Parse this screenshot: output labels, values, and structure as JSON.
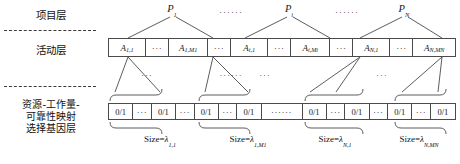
{
  "figure": {
    "layers": [
      {
        "id": "project",
        "label": "项目层"
      },
      {
        "id": "activity",
        "label": "活动层"
      },
      {
        "id": "gene",
        "label": "资源-工作量-\n可靠性映射\n选择基因层"
      }
    ],
    "separators": [
      "dashed",
      "dashed"
    ]
  },
  "project_layer": {
    "nodes": [
      {
        "base": "P",
        "sub": "1",
        "x": 172
      },
      {
        "base": "P",
        "sub": "i",
        "x": 289
      },
      {
        "base": "P",
        "sub": "N",
        "x": 404
      }
    ],
    "ellipses": [
      {
        "text": "······",
        "x": 231
      },
      {
        "text": "······",
        "x": 347
      }
    ]
  },
  "activity_layer": {
    "cells": [
      {
        "type": "label",
        "base": "A",
        "sub": "1,1",
        "width": 40
      },
      {
        "type": "dots",
        "text": "···",
        "width": 25
      },
      {
        "type": "label",
        "base": "A",
        "sub": "1,M1",
        "width": 42
      },
      {
        "type": "dots",
        "text": "···",
        "width": 25
      },
      {
        "type": "label",
        "base": "A",
        "sub": "i,1",
        "width": 40
      },
      {
        "type": "dots",
        "text": "···",
        "width": 25
      },
      {
        "type": "label",
        "base": "A",
        "sub": "i,Mi",
        "width": 42
      },
      {
        "type": "dots",
        "text": "···",
        "width": 25
      },
      {
        "type": "label",
        "base": "A",
        "sub": "N,1",
        "width": 40
      },
      {
        "type": "dots",
        "text": "···",
        "width": 25
      },
      {
        "type": "label",
        "base": "A",
        "sub": "N,MN",
        "width": 45
      }
    ],
    "mid_ellipses": [
      {
        "text": "···",
        "x": 147
      },
      {
        "text": "······",
        "x": 231
      },
      {
        "text": "···",
        "x": 265
      },
      {
        "text": "···",
        "x": 382
      }
    ]
  },
  "gene_layer": {
    "cells": [
      {
        "type": "bits",
        "text": "0/1",
        "width": 29
      },
      {
        "type": "dots",
        "text": "···",
        "width": 22
      },
      {
        "type": "bits",
        "text": "0/1",
        "width": 29
      },
      {
        "type": "dots",
        "text": "···",
        "width": 22
      },
      {
        "type": "bits",
        "text": "0/1",
        "width": 29
      },
      {
        "type": "dots",
        "text": "···",
        "width": 22
      },
      {
        "type": "bits",
        "text": "0/1",
        "width": 29
      },
      {
        "type": "dots",
        "text": "······",
        "width": 49
      },
      {
        "type": "bits",
        "text": "0/1",
        "width": 29
      },
      {
        "type": "dots",
        "text": "···",
        "width": 22
      },
      {
        "type": "bits",
        "text": "0/1",
        "width": 29
      },
      {
        "type": "dots",
        "text": "···",
        "width": 22
      },
      {
        "type": "bits",
        "text": "0/1",
        "width": 29
      },
      {
        "type": "dots",
        "text": "···",
        "width": 22
      },
      {
        "type": "bits",
        "text": "0/1",
        "width": 29
      }
    ],
    "size_labels": [
      {
        "prefix": "Size=",
        "symbol": "λ",
        "sub": "1,1",
        "x": 160
      },
      {
        "prefix": "Size=",
        "symbol": "λ",
        "sub": "1,M1",
        "x": 248
      },
      {
        "prefix": "Size=",
        "symbol": "λ",
        "sub": "N,1",
        "x": 335
      },
      {
        "prefix": "Size=",
        "symbol": "λ",
        "sub": "N,MN",
        "x": 419
      }
    ]
  },
  "colors": {
    "line": "#4a4a4a",
    "text": "#111111",
    "background": "#ffffff"
  }
}
